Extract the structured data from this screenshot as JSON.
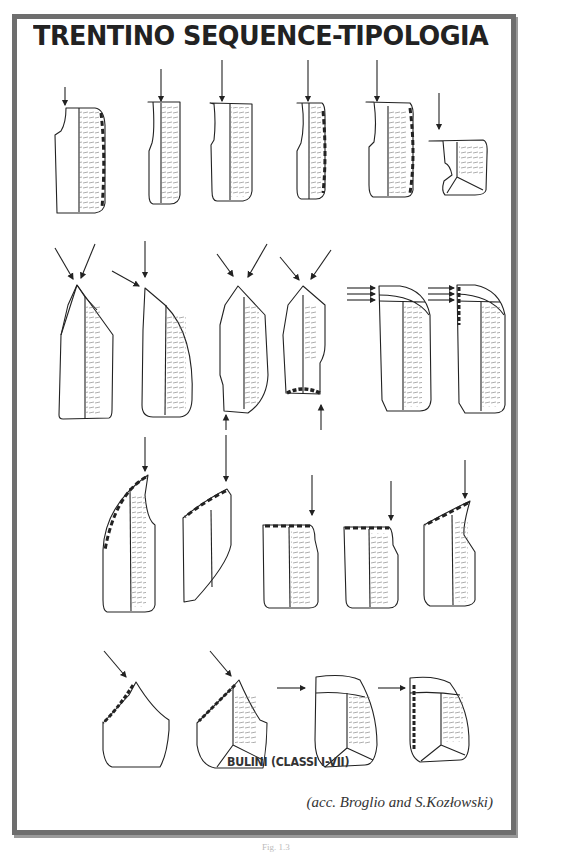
{
  "plate": {
    "title": "TRENTINO SEQUENCE-TIPOLOGIA",
    "caption": "BULINI (CLASSI I-VII)",
    "credit": "(acc. Broglio and S.Kozłowski)",
    "figure_ref": "Fig. 1.3"
  },
  "colors": {
    "frame": "#6e6e6e",
    "ink": "#222222",
    "background": "#ffffff"
  },
  "rows": [
    {
      "name": "row-1",
      "items": 6,
      "type": "straight burins with retouched edges, vertical blow arrows"
    },
    {
      "name": "row-2",
      "items": 6,
      "type": "dihedral burins, converging arrows; last two with multiple transverse removals"
    },
    {
      "name": "row-3",
      "items": 5,
      "type": "burins on oblique truncation, retouched"
    },
    {
      "name": "row-4",
      "items": 4,
      "type": "angle burins and transverse burins"
    }
  ]
}
